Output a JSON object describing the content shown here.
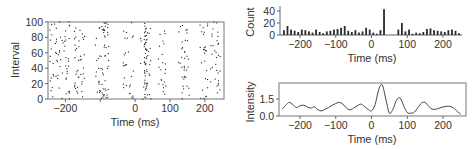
{
  "chart_data": [
    {
      "id": "raster",
      "type": "scatter",
      "title": "",
      "xlabel": "Time (ms)",
      "ylabel": "Interval",
      "xlim": [
        -250,
        255
      ],
      "ylim": [
        0,
        100
      ],
      "xticks": [
        -200,
        -100,
        0,
        100,
        200
      ],
      "xtick_labels": [
        "−200",
        "",
        "0",
        "100",
        "200"
      ],
      "yticks": [
        0,
        20,
        40,
        60,
        80,
        100
      ],
      "ytick_labels": [
        "0",
        "20",
        "40",
        "60",
        "80",
        "100"
      ],
      "grid": false,
      "frame": "box",
      "description": "Spike raster: ~100 intervals (rows), each dot a spike time; dense vertical band near +30 ms, sparse gap ~40-70 ms and ~100-130 ms",
      "dense_band_ms": 30,
      "clusters_ms": [
        -230,
        -200,
        -160,
        -100,
        -90,
        -20,
        30,
        75,
        140,
        200,
        230
      ]
    },
    {
      "id": "histogram",
      "type": "bar",
      "title": "",
      "xlabel": "Time (ms)",
      "ylabel": "Count",
      "xlim": [
        -260,
        265
      ],
      "ylim": [
        0,
        45
      ],
      "xticks": [
        -200,
        -100,
        0,
        100,
        200
      ],
      "xtick_labels": [
        "−200",
        "−100",
        "0",
        "100",
        "200"
      ],
      "yticks": [
        0,
        20,
        40
      ],
      "ytick_labels": [
        "0",
        "20",
        "40"
      ],
      "grid": false,
      "bin_width_ms": 10,
      "categories": [
        -245,
        -235,
        -225,
        -215,
        -205,
        -195,
        -185,
        -175,
        -165,
        -155,
        -145,
        -135,
        -125,
        -115,
        -105,
        -95,
        -85,
        -75,
        -65,
        -55,
        -45,
        -35,
        -25,
        -15,
        -5,
        5,
        15,
        25,
        35,
        45,
        55,
        65,
        75,
        85,
        95,
        105,
        115,
        125,
        135,
        145,
        155,
        165,
        175,
        185,
        195,
        205,
        215,
        225,
        235,
        245
      ],
      "values": [
        8,
        15,
        9,
        7,
        5,
        9,
        8,
        6,
        4,
        9,
        5,
        3,
        6,
        7,
        9,
        10,
        12,
        15,
        7,
        5,
        8,
        4,
        6,
        12,
        9,
        4,
        2,
        8,
        43,
        0,
        0,
        0,
        9,
        20,
        6,
        9,
        2,
        4,
        3,
        5,
        10,
        11,
        8,
        7,
        6,
        5,
        8,
        9,
        7,
        3
      ]
    },
    {
      "id": "intensity",
      "type": "line",
      "title": "",
      "xlabel": "Time (ms)",
      "ylabel": "Intensity",
      "xlim": [
        -260,
        265
      ],
      "ylim": [
        0,
        3.0
      ],
      "xticks": [
        -200,
        -100,
        0,
        100,
        200
      ],
      "xtick_labels": [
        "−200",
        "−100",
        "0",
        "100",
        "200"
      ],
      "yticks": [
        0.0,
        1.5
      ],
      "ytick_labels": [
        "0.0",
        "1.5"
      ],
      "grid": false,
      "frame": "box",
      "x": [
        -250,
        -240,
        -230,
        -220,
        -210,
        -200,
        -190,
        -180,
        -170,
        -160,
        -150,
        -140,
        -130,
        -120,
        -110,
        -100,
        -90,
        -80,
        -70,
        -60,
        -50,
        -40,
        -30,
        -20,
        -10,
        0,
        10,
        20,
        30,
        40,
        50,
        60,
        70,
        80,
        90,
        100,
        110,
        120,
        130,
        140,
        150,
        160,
        170,
        180,
        190,
        200,
        210,
        220,
        230,
        240,
        250
      ],
      "y": [
        0.6,
        0.95,
        1.2,
        1.0,
        0.75,
        0.9,
        0.95,
        0.8,
        0.7,
        0.8,
        0.55,
        0.45,
        0.6,
        0.75,
        0.95,
        1.1,
        1.2,
        1.05,
        0.7,
        0.55,
        0.7,
        0.9,
        1.05,
        0.85,
        0.6,
        0.45,
        1.0,
        2.3,
        2.75,
        1.5,
        0.25,
        0.6,
        1.4,
        1.6,
        0.9,
        0.3,
        0.25,
        0.35,
        0.75,
        1.15,
        1.2,
        0.85,
        0.6,
        0.6,
        0.7,
        0.8,
        0.85,
        0.85,
        0.7,
        0.4,
        0.15
      ]
    }
  ],
  "labels": {
    "raster_xlabel": "Time (ms)",
    "raster_ylabel": "Interval",
    "hist_xlabel": "Time (ms)",
    "hist_ylabel": "Count",
    "intensity_xlabel": "Time (ms)",
    "intensity_ylabel": "Intensity"
  },
  "colors": {
    "ink": "#333333",
    "frame": "#666666",
    "bar": "#2a2a2a",
    "dot": "#222222",
    "line": "#444444"
  }
}
